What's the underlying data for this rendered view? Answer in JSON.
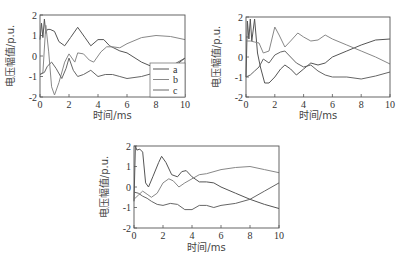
{
  "figure": {
    "xlabel": "时间/ms",
    "ylabel": "电压幅值/p.u."
  },
  "chart_data": [
    {
      "type": "line",
      "panel": "top-left",
      "xlabel": "时间/ms",
      "ylabel": "电压幅值/p.u.",
      "xlim": [
        0,
        10
      ],
      "ylim": [
        -2,
        2
      ],
      "xticks": [
        0,
        2,
        4,
        6,
        8,
        10
      ],
      "yticks": [
        -2,
        -1,
        0,
        1,
        2
      ],
      "grid": false,
      "legend": {
        "position": "lower right",
        "entries": [
          "a",
          "b",
          "c"
        ]
      },
      "series": [
        {
          "name": "a",
          "color": "#555555",
          "points": [
            [
              0,
              0.8
            ],
            [
              0.1,
              1.6
            ],
            [
              0.2,
              0.9
            ],
            [
              0.3,
              1.8
            ],
            [
              0.4,
              1.1
            ],
            [
              0.5,
              1.3
            ],
            [
              0.7,
              1.3
            ],
            [
              1.0,
              1.2
            ],
            [
              1.3,
              0.7
            ],
            [
              1.7,
              0.5
            ],
            [
              2.1,
              0.9
            ],
            [
              2.6,
              1.4
            ],
            [
              3.1,
              0.9
            ],
            [
              3.5,
              0.5
            ],
            [
              4.0,
              0.8
            ],
            [
              4.4,
              0.8
            ],
            [
              4.8,
              0.5
            ],
            [
              5.5,
              0.25
            ],
            [
              6.0,
              0.15
            ],
            [
              7.0,
              -0.3
            ],
            [
              8.0,
              -0.6
            ],
            [
              9.0,
              -0.65
            ],
            [
              10,
              -0.1
            ]
          ]
        },
        {
          "name": "b",
          "color": "#888888",
          "points": [
            [
              0,
              -0.9
            ],
            [
              0.2,
              -0.8
            ],
            [
              0.4,
              1.5
            ],
            [
              0.6,
              0.2
            ],
            [
              0.8,
              -1.5
            ],
            [
              1.0,
              -1.9
            ],
            [
              1.3,
              -1.3
            ],
            [
              1.7,
              -0.3
            ],
            [
              2.0,
              0.1
            ],
            [
              2.4,
              -0.3
            ],
            [
              2.6,
              0.15
            ],
            [
              3.0,
              0.1
            ],
            [
              3.4,
              -0.2
            ],
            [
              3.7,
              -0.3
            ],
            [
              4.2,
              0.2
            ],
            [
              4.6,
              0.45
            ],
            [
              5.0,
              0.45
            ],
            [
              5.5,
              0.4
            ],
            [
              6.0,
              0.6
            ],
            [
              7.0,
              0.9
            ],
            [
              8.0,
              1.0
            ],
            [
              9.0,
              0.95
            ],
            [
              10,
              0.8
            ]
          ]
        },
        {
          "name": "c",
          "color": "#666666",
          "points": [
            [
              0,
              -0.9
            ],
            [
              0.3,
              -0.8
            ],
            [
              0.5,
              -0.5
            ],
            [
              0.8,
              -0.3
            ],
            [
              1.1,
              -0.6
            ],
            [
              1.5,
              -1.1
            ],
            [
              1.8,
              -0.6
            ],
            [
              2.0,
              -0.1
            ],
            [
              2.3,
              -0.7
            ],
            [
              2.6,
              -1.0
            ],
            [
              3.0,
              -0.9
            ],
            [
              3.5,
              -0.7
            ],
            [
              4.0,
              -1.0
            ],
            [
              4.5,
              -0.9
            ],
            [
              5.0,
              -0.9
            ],
            [
              5.5,
              -1.0
            ],
            [
              6.0,
              -1.1
            ],
            [
              7.0,
              -1.0
            ],
            [
              8.0,
              -0.8
            ],
            [
              9.0,
              -0.5
            ],
            [
              10,
              -0.1
            ]
          ]
        }
      ]
    },
    {
      "type": "line",
      "panel": "top-right",
      "xlabel": "时间/ms",
      "ylabel": "电压幅值/p.u.",
      "xlim": [
        0,
        10
      ],
      "ylim": [
        -2,
        2
      ],
      "xticks": [
        0,
        2,
        4,
        6,
        8,
        10
      ],
      "yticks": [
        -2,
        -1,
        0,
        1,
        2
      ],
      "grid": false,
      "series": [
        {
          "name": "a",
          "color": "#555555",
          "points": [
            [
              0,
              -1.0
            ],
            [
              0.1,
              1.8
            ],
            [
              0.2,
              0.9
            ],
            [
              0.3,
              1.9
            ],
            [
              0.4,
              0.8
            ],
            [
              0.6,
              1.9
            ],
            [
              0.8,
              0.2
            ],
            [
              1.0,
              -0.5
            ],
            [
              1.3,
              -1.3
            ],
            [
              1.6,
              -1.3
            ],
            [
              2.0,
              -1.0
            ],
            [
              2.4,
              -0.6
            ],
            [
              2.7,
              -0.4
            ],
            [
              3.1,
              -0.6
            ],
            [
              3.5,
              -0.9
            ],
            [
              4.0,
              -0.6
            ],
            [
              4.5,
              -0.3
            ],
            [
              5.0,
              -0.4
            ],
            [
              5.5,
              -0.3
            ],
            [
              6.0,
              0.0
            ],
            [
              7.0,
              0.3
            ],
            [
              8.0,
              0.6
            ],
            [
              9.0,
              0.85
            ],
            [
              10,
              0.9
            ]
          ]
        },
        {
          "name": "b",
          "color": "#888888",
          "points": [
            [
              0,
              0.8
            ],
            [
              0.3,
              0.8
            ],
            [
              0.6,
              0.75
            ],
            [
              0.9,
              0.7
            ],
            [
              1.2,
              0.2
            ],
            [
              1.6,
              0.3
            ],
            [
              2.0,
              1.5
            ],
            [
              2.3,
              1.1
            ],
            [
              2.7,
              0.5
            ],
            [
              3.1,
              0.8
            ],
            [
              3.6,
              1.2
            ],
            [
              4.0,
              1.0
            ],
            [
              4.5,
              0.8
            ],
            [
              5.0,
              0.85
            ],
            [
              5.5,
              1.1
            ],
            [
              6.0,
              0.9
            ],
            [
              7.0,
              0.6
            ],
            [
              7.5,
              0.45
            ],
            [
              8.0,
              0.3
            ],
            [
              9.0,
              0.0
            ],
            [
              10,
              -0.35
            ]
          ]
        },
        {
          "name": "c",
          "color": "#666666",
          "points": [
            [
              0,
              -1.0
            ],
            [
              0.3,
              -0.9
            ],
            [
              0.6,
              -0.7
            ],
            [
              0.9,
              -0.5
            ],
            [
              1.2,
              -0.1
            ],
            [
              1.6,
              -0.3
            ],
            [
              2.0,
              0.1
            ],
            [
              2.4,
              0.25
            ],
            [
              2.7,
              0.3
            ],
            [
              3.1,
              0.0
            ],
            [
              3.5,
              -0.3
            ],
            [
              4.0,
              -0.5
            ],
            [
              4.5,
              -0.4
            ],
            [
              5.0,
              -0.7
            ],
            [
              5.5,
              -0.9
            ],
            [
              6.0,
              -1.0
            ],
            [
              7.0,
              -1.0
            ],
            [
              8.0,
              -1.1
            ],
            [
              9.0,
              -0.95
            ],
            [
              10,
              -0.75
            ]
          ]
        }
      ]
    },
    {
      "type": "line",
      "panel": "bottom-center",
      "xlabel": "时间/ms",
      "ylabel": "电压幅值/p.u.",
      "xlim": [
        0,
        10
      ],
      "ylim": [
        -2,
        2
      ],
      "xticks": [
        0,
        2,
        4,
        6,
        8,
        10
      ],
      "yticks": [
        -2,
        -1,
        0,
        1,
        2
      ],
      "grid": false,
      "series": [
        {
          "name": "a",
          "color": "#555555",
          "points": [
            [
              0,
              -0.7
            ],
            [
              0.1,
              2.0
            ],
            [
              0.2,
              1.8
            ],
            [
              0.4,
              1.85
            ],
            [
              0.6,
              1.7
            ],
            [
              0.8,
              0.2
            ],
            [
              1.0,
              0.0
            ],
            [
              1.3,
              0.5
            ],
            [
              1.7,
              1.2
            ],
            [
              1.9,
              1.5
            ],
            [
              2.2,
              1.2
            ],
            [
              2.6,
              0.6
            ],
            [
              3.0,
              0.5
            ],
            [
              3.3,
              0.75
            ],
            [
              3.6,
              0.8
            ],
            [
              4.0,
              0.5
            ],
            [
              4.5,
              0.25
            ],
            [
              5.0,
              0.25
            ],
            [
              5.5,
              0.2
            ],
            [
              6.0,
              0.0
            ],
            [
              7.0,
              -0.3
            ],
            [
              8.0,
              -0.6
            ],
            [
              9.0,
              -0.85
            ],
            [
              10,
              -1.05
            ]
          ]
        },
        {
          "name": "b",
          "color": "#888888",
          "points": [
            [
              0,
              -0.6
            ],
            [
              0.3,
              -0.4
            ],
            [
              0.6,
              -0.2
            ],
            [
              0.9,
              -0.35
            ],
            [
              1.2,
              -0.5
            ],
            [
              1.6,
              -0.3
            ],
            [
              2.0,
              0.2
            ],
            [
              2.4,
              0.4
            ],
            [
              2.7,
              0.3
            ],
            [
              3.1,
              0.0
            ],
            [
              3.5,
              0.2
            ],
            [
              4.0,
              0.4
            ],
            [
              4.5,
              0.6
            ],
            [
              5.0,
              0.65
            ],
            [
              6.0,
              0.85
            ],
            [
              7.0,
              0.95
            ],
            [
              8.0,
              1.0
            ],
            [
              9.0,
              0.85
            ],
            [
              10,
              0.7
            ]
          ]
        },
        {
          "name": "c",
          "color": "#666666",
          "points": [
            [
              0,
              -0.25
            ],
            [
              0.3,
              -0.3
            ],
            [
              0.6,
              -0.45
            ],
            [
              0.9,
              -0.55
            ],
            [
              1.2,
              -0.7
            ],
            [
              1.6,
              -0.85
            ],
            [
              2.0,
              -0.9
            ],
            [
              2.5,
              -0.8
            ],
            [
              3.0,
              -0.85
            ],
            [
              3.5,
              -1.1
            ],
            [
              4.0,
              -1.1
            ],
            [
              4.5,
              -0.9
            ],
            [
              5.0,
              -0.9
            ],
            [
              5.5,
              -1.0
            ],
            [
              6.0,
              -0.9
            ],
            [
              7.0,
              -0.8
            ],
            [
              8.0,
              -0.6
            ],
            [
              9.0,
              -0.2
            ],
            [
              10,
              0.2
            ]
          ]
        }
      ]
    }
  ],
  "layout": {
    "panels": [
      {
        "x0": 40,
        "x1": 185,
        "y0": 15,
        "y1": 97,
        "show_legend": true,
        "ylabel_x": 14,
        "xlabel_y": 119
      },
      {
        "x0": 246,
        "x1": 390,
        "y0": 17,
        "y1": 97,
        "show_legend": false,
        "ylabel_x": 220,
        "xlabel_y": 119
      },
      {
        "x0": 134,
        "x1": 279,
        "y0": 146,
        "y1": 228,
        "show_legend": false,
        "ylabel_x": 108,
        "xlabel_y": 251
      }
    ],
    "legend": {
      "x": 150,
      "y": 63,
      "w": 35,
      "h": 34
    }
  }
}
